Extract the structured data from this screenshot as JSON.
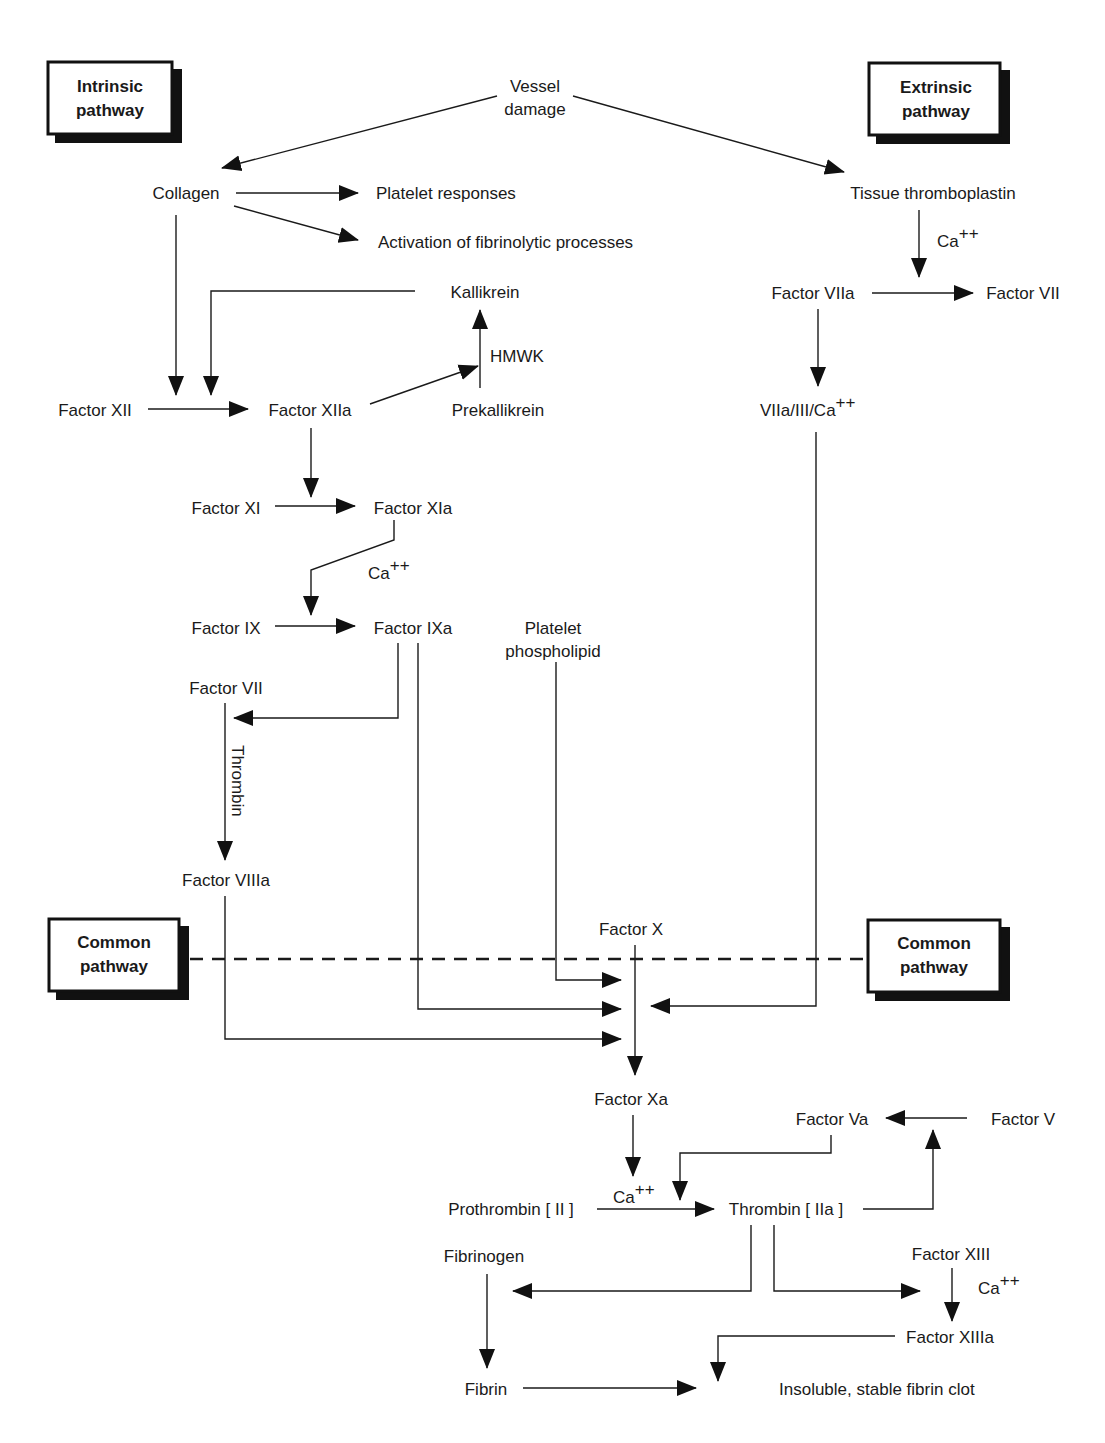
{
  "title_boxes": {
    "intrinsic": [
      "Intrinsic",
      "pathway"
    ],
    "extrinsic": [
      "Extrinsic",
      "pathway"
    ],
    "common_left": [
      "Common",
      "pathway"
    ],
    "common_right": [
      "Common",
      "pathway"
    ]
  },
  "nodes": {
    "vessel_damage": [
      "Vessel",
      "damage"
    ],
    "collagen": "Collagen",
    "platelet_responses": "Platelet responses",
    "fibrinolytic": "Activation of fibrinolytic processes",
    "tissue_thromboplastin": "Tissue thromboplastin",
    "ca_extrinsic": "Ca",
    "factor_viia": "Factor VIIa",
    "factor_vii_ext": "Factor VII",
    "viia_iii_ca": "VIIa/III/Ca",
    "kallikrein": "Kallikrein",
    "hmwk": "HMWK",
    "prekallikrein": "Prekallikrein",
    "factor_xii": "Factor XII",
    "factor_xiia": "Factor XIIa",
    "factor_xi": "Factor XI",
    "factor_xia": "Factor XIa",
    "ca_xia": "Ca",
    "factor_ix": "Factor IX",
    "factor_ixa": "Factor IXa",
    "platelet_phospholipid": [
      "Platelet",
      "phospholipid"
    ],
    "factor_vii_int": "Factor VII",
    "thrombin_label": "Thrombin",
    "factor_viiia": "Factor VIIIa",
    "factor_x": "Factor X",
    "factor_xa": "Factor Xa",
    "factor_va": "Factor Va",
    "factor_v": "Factor V",
    "ca_prothrombin": "Ca",
    "prothrombin": "Prothrombin [ II ]",
    "thrombin": "Thrombin [ IIa ]",
    "fibrinogen": "Fibrinogen",
    "factor_xiii": "Factor XIII",
    "ca_xiii": "Ca",
    "factor_xiiia": "Factor XIIIa",
    "fibrin": "Fibrin",
    "clot": "Insoluble, stable fibrin clot"
  },
  "superscript": "++",
  "colors": {
    "ink": "#1a1a1a",
    "background": "#ffffff"
  }
}
